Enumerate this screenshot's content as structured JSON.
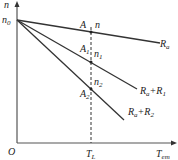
{
  "diagram": {
    "axes": {
      "y_label": "n",
      "x_label": "T",
      "x_label_sub": "em",
      "origin": "O",
      "y_intercept": "n",
      "y_intercept_sub": "0",
      "x_tick": "T",
      "x_tick_sub": "L"
    },
    "lines": [
      {
        "label": "R",
        "label_sub": "a",
        "label_suffix": "",
        "label_suffix_sub": "",
        "point": "A",
        "point_sub": "",
        "speed": "n",
        "speed_sub": ""
      },
      {
        "label": "R",
        "label_sub": "a",
        "label_suffix": "+R",
        "label_suffix_sub": "1",
        "point": "A",
        "point_sub": "1",
        "speed": "n",
        "speed_sub": "1"
      },
      {
        "label": "R",
        "label_sub": "a",
        "label_suffix": "+R",
        "label_suffix_sub": "2",
        "point": "A",
        "point_sub": "2",
        "speed": "n",
        "speed_sub": "2"
      }
    ],
    "colors": {
      "line": "#333333",
      "axis": "#555555"
    }
  }
}
